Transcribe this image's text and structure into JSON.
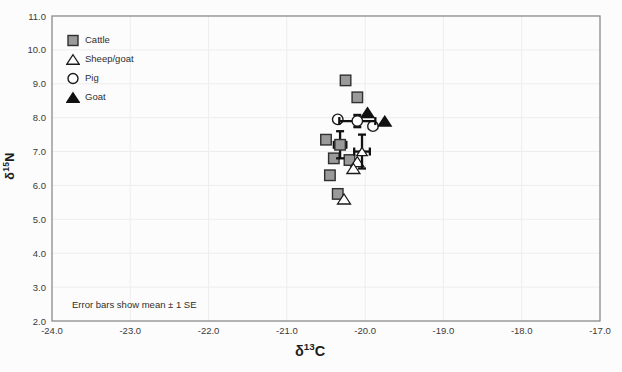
{
  "figure": {
    "kind": "scatter chart figure",
    "background": "#fcfcfc"
  },
  "colors": {
    "plot_border": "#8a8a8a",
    "gridline": "#ededed",
    "tick_text": "#3a3a3a",
    "error_bar": "#111111",
    "cattle_fill": "#9a9a9a",
    "cattle_stroke": "#2f2f2f",
    "open_fill": "#ffffff",
    "open_stroke": "#1a1a1a",
    "goat_fill": "#111111"
  },
  "chart_data": {
    "type": "scatter",
    "title": "",
    "xlabel": "δ13C",
    "ylabel": "δ15N",
    "xlabel_parts": {
      "prefix": "δ",
      "sup": "13",
      "suffix": "C"
    },
    "ylabel_parts": {
      "prefix": "δ",
      "sup": "15",
      "suffix": "N"
    },
    "xlim": [
      -24.0,
      -17.0
    ],
    "ylim": [
      2.0,
      11.0
    ],
    "grid": true,
    "legend_position": "top-left-inside",
    "annotation": "Error bars show mean ± 1 SE",
    "x_ticks": [
      "-24.0",
      "-23.0",
      "-22.0",
      "-21.0",
      "-20.0",
      "-19.0",
      "-18.0",
      "-17.0"
    ],
    "x_tick_values": [
      -24,
      -23,
      -22,
      -21,
      -20,
      -19,
      -18,
      -17
    ],
    "y_ticks": [
      "11.0",
      "10.0",
      "9.0",
      "8.0",
      "7.0",
      "6.0",
      "5.0",
      "4.0",
      "3.0",
      "2.0"
    ],
    "y_tick_values": [
      11,
      10,
      9,
      8,
      7,
      6,
      5,
      4,
      3,
      2
    ],
    "series": [
      {
        "name": "Cattle",
        "marker": "square",
        "fill": "#9a9a9a",
        "stroke": "#2f2f2f",
        "points": [
          [
            -20.25,
            9.1
          ],
          [
            -20.1,
            8.6
          ],
          [
            -20.5,
            7.35
          ],
          [
            -20.4,
            6.8
          ],
          [
            -20.2,
            6.75
          ],
          [
            -20.45,
            6.3
          ],
          [
            -20.35,
            5.75
          ]
        ]
      },
      {
        "name": "Sheep/goat",
        "marker": "triangle-open",
        "fill": "#ffffff",
        "stroke": "#1a1a1a",
        "points": [
          [
            -20.1,
            6.7
          ],
          [
            -20.15,
            6.5
          ],
          [
            -20.27,
            5.6
          ]
        ]
      },
      {
        "name": "Pig",
        "marker": "circle-open",
        "fill": "#ffffff",
        "stroke": "#1a1a1a",
        "points": [
          [
            -20.35,
            7.95
          ],
          [
            -19.9,
            7.75
          ]
        ]
      },
      {
        "name": "Goat",
        "marker": "triangle-filled",
        "fill": "#111111",
        "stroke": "#111111",
        "points": [
          [
            -19.97,
            8.15
          ],
          [
            -19.75,
            7.9
          ]
        ]
      }
    ],
    "means": [
      {
        "series": "Cattle",
        "marker": "square",
        "x": -20.32,
        "y": 7.2,
        "x_se": 0.08,
        "y_se": 0.4
      },
      {
        "series": "Sheep/goat",
        "marker": "triangle-open",
        "x": -20.04,
        "y": 7.0,
        "x_se": 0.1,
        "y_se": 0.5
      },
      {
        "series": "Pig",
        "marker": "circle-open",
        "x": -20.1,
        "y": 7.9,
        "x_se": 0.23,
        "y_se": 0.18
      }
    ]
  }
}
